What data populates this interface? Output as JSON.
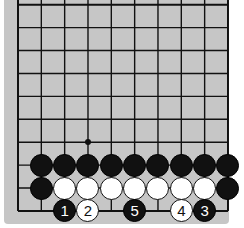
{
  "board": {
    "size": 10,
    "background": "#c6c6c6",
    "line_color": "#111111",
    "origin_x": 18,
    "origin_y": 4.7,
    "spacing_x": 23.33,
    "spacing_y": 22.92,
    "star_points": [
      {
        "col": 3,
        "row": 6
      }
    ]
  },
  "stones": [
    {
      "col": 1,
      "row": 7,
      "color": "black",
      "label": ""
    },
    {
      "col": 2,
      "row": 7,
      "color": "black",
      "label": ""
    },
    {
      "col": 3,
      "row": 7,
      "color": "black",
      "label": ""
    },
    {
      "col": 4,
      "row": 7,
      "color": "black",
      "label": ""
    },
    {
      "col": 5,
      "row": 7,
      "color": "black",
      "label": ""
    },
    {
      "col": 6,
      "row": 7,
      "color": "black",
      "label": ""
    },
    {
      "col": 7,
      "row": 7,
      "color": "black",
      "label": ""
    },
    {
      "col": 8,
      "row": 7,
      "color": "black",
      "label": ""
    },
    {
      "col": 9,
      "row": 7,
      "color": "black",
      "label": ""
    },
    {
      "col": 1,
      "row": 8,
      "color": "black",
      "label": ""
    },
    {
      "col": 2,
      "row": 8,
      "color": "white",
      "label": ""
    },
    {
      "col": 3,
      "row": 8,
      "color": "white",
      "label": ""
    },
    {
      "col": 4,
      "row": 8,
      "color": "white",
      "label": ""
    },
    {
      "col": 5,
      "row": 8,
      "color": "white",
      "label": ""
    },
    {
      "col": 6,
      "row": 8,
      "color": "white",
      "label": ""
    },
    {
      "col": 7,
      "row": 8,
      "color": "white",
      "label": ""
    },
    {
      "col": 8,
      "row": 8,
      "color": "white",
      "label": ""
    },
    {
      "col": 9,
      "row": 8,
      "color": "black",
      "label": ""
    },
    {
      "col": 2,
      "row": 9,
      "color": "black",
      "label": "1"
    },
    {
      "col": 3,
      "row": 9,
      "color": "white",
      "label": "2"
    },
    {
      "col": 8,
      "row": 9,
      "color": "black",
      "label": "3"
    },
    {
      "col": 7,
      "row": 9,
      "color": "white",
      "label": "4"
    },
    {
      "col": 5,
      "row": 9,
      "color": "black",
      "label": "5"
    }
  ]
}
